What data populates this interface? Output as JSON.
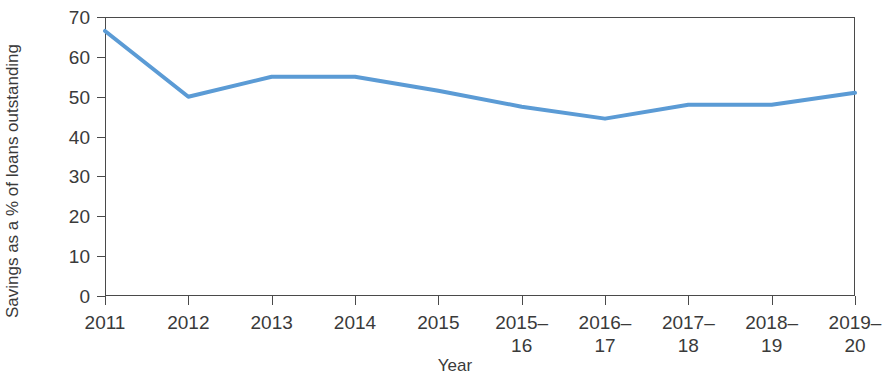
{
  "chart_data": {
    "type": "line",
    "title": "",
    "subtitle": "",
    "xlabel": "Year",
    "ylabel": "Savings as a % of loans outstanding",
    "categories": [
      "2011",
      "2012",
      "2013",
      "2014",
      "2015",
      "2015–\n16",
      "2016–\n17",
      "2017–\n18",
      "2018–\n19",
      "2019–\n20"
    ],
    "categories_flat": [
      "2011",
      "2012",
      "2013",
      "2014",
      "2015",
      "2015–16",
      "2016–17",
      "2017–18",
      "2018–19",
      "2019–20"
    ],
    "values": [
      66.5,
      50.0,
      55.0,
      55.0,
      51.5,
      47.5,
      44.5,
      48.0,
      48.0,
      51.0
    ],
    "series": [
      {
        "name": "Savings as a % of loans outstanding",
        "values": [
          66.5,
          50.0,
          55.0,
          55.0,
          51.5,
          47.5,
          44.5,
          48.0,
          48.0,
          51.0
        ],
        "color": "#5B9BD5"
      }
    ],
    "ylim": [
      0,
      70
    ],
    "yticks": [
      0,
      10,
      20,
      30,
      40,
      50,
      60,
      70
    ],
    "ytick_labels": [
      "0",
      "10",
      "20",
      "30",
      "40",
      "50",
      "60",
      "70"
    ],
    "grid": false,
    "legend": false,
    "legend_position": "none",
    "line_color": "#5B9BD5",
    "line_width": 4,
    "axis_color": "#4A4A4A",
    "text_color": "#3A3A3A",
    "background_color": "#FFFFFF"
  }
}
